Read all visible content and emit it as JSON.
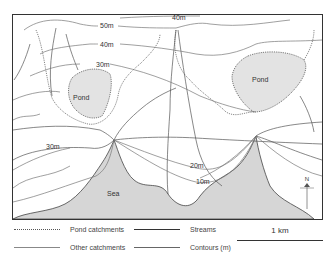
{
  "map": {
    "labels": {
      "pond_left": "Pond",
      "pond_right": "Pond",
      "sea": "Sea",
      "north": "N"
    },
    "contours": [
      {
        "label": "50m"
      },
      {
        "label": "40m"
      },
      {
        "label": "40m"
      },
      {
        "label": "30m"
      },
      {
        "label": "30m"
      },
      {
        "label": "20m"
      },
      {
        "label": "10m"
      }
    ],
    "colors": {
      "pond_fill": "#e3e3e3",
      "sea_fill": "#d6d6d6",
      "line": "#555555",
      "frame": "#333333"
    }
  },
  "legend": {
    "items": [
      {
        "label": "Pond catchments",
        "style": "dotted"
      },
      {
        "label": "Other catchments",
        "style": "solid thin"
      },
      {
        "label": "Streams",
        "style": "solid dark"
      },
      {
        "label": "Contours (m)",
        "style": "solid"
      }
    ]
  },
  "scale": {
    "label": "1 km"
  }
}
